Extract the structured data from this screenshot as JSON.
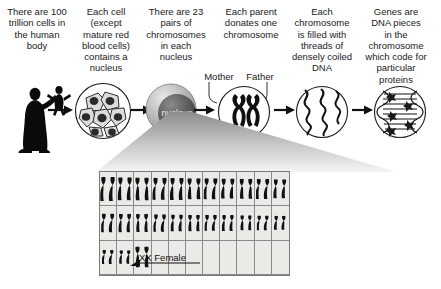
{
  "diagram": {
    "captions": [
      {
        "id": "cells-in-body",
        "text": "There are 100\ntrillion cells in\nthe human\nbody"
      },
      {
        "id": "cell-nucleus",
        "text": "Each cell\n(except\nmature red\nblood cells)\ncontains a\nnucleus"
      },
      {
        "id": "chromosome-pairs",
        "text": "There are 23\npairs of\nchromosomes\nin each\nnucleus"
      },
      {
        "id": "parent-donates",
        "text": "Each parent\ndonates one\nchromosome"
      },
      {
        "id": "coiled-dna",
        "text": "Each\nchromosome\nis filled with\nthreads of\ndensely coiled\nDNA"
      },
      {
        "id": "genes-proteins",
        "text": "Genes are\nDNA pieces\nin the\nchromosome\nwhich code for\nparticular\nproteins"
      }
    ],
    "parent_labels": {
      "mother": "Mother",
      "father": "Father"
    },
    "nucleus_label": "nucleus",
    "stages": [
      {
        "id": "human-body",
        "icon": "person-silhouette-icon"
      },
      {
        "id": "cells",
        "icon": "cell-cluster-icon"
      },
      {
        "id": "nucleus",
        "icon": "nucleus-sphere-icon"
      },
      {
        "id": "chromosomes",
        "icon": "chromosome-pair-icon"
      },
      {
        "id": "dna-threads",
        "icon": "dna-helix-icon"
      },
      {
        "id": "genes",
        "icon": "gene-ladder-icon"
      }
    ],
    "karyotype": {
      "columns": 11,
      "rows": 3,
      "annotation": "XX Female",
      "row_fill": [
        11,
        11,
        3
      ]
    },
    "colors": {
      "background": "#ffffff",
      "text": "#1a1a1a",
      "table_background": "#eceae6",
      "table_border": "#7a7a7a",
      "chromosome": "#111111",
      "cone_light": "#f2f2f2",
      "cone_dark": "#8c8c8c"
    }
  }
}
